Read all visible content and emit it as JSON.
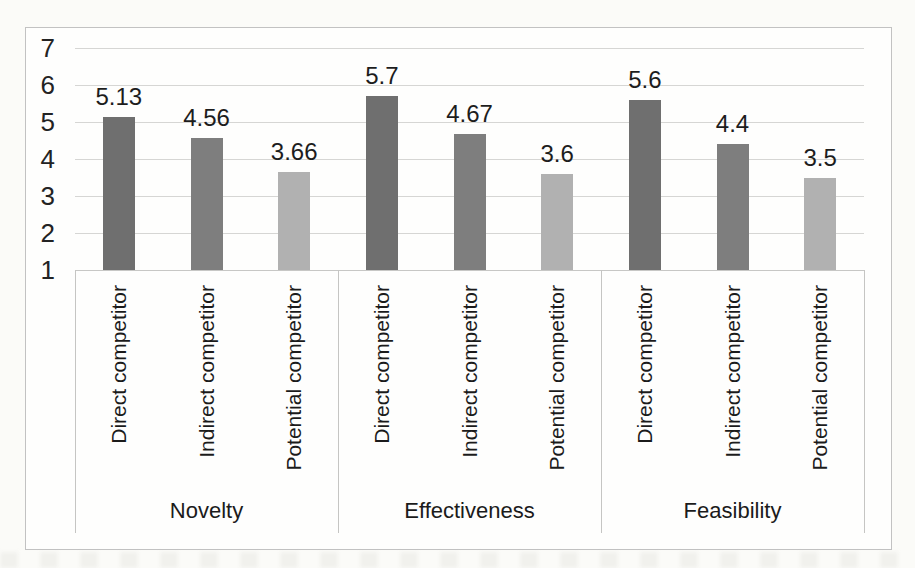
{
  "chart_data": {
    "type": "bar",
    "title": "",
    "y_axis": {
      "min": 1,
      "max": 7,
      "tick_labels": [
        "7",
        "6",
        "5",
        "4",
        "3",
        "2",
        "1"
      ],
      "gridlines": true
    },
    "categories_per_group": [
      "Direct competitor",
      "Indirect competitor",
      "Potential competitor"
    ],
    "groups": [
      {
        "label": "Novelty",
        "bars": [
          {
            "category": "Direct competitor",
            "value": 5.13,
            "value_label": "5.13"
          },
          {
            "category": "Indirect competitor",
            "value": 4.56,
            "value_label": "4.56"
          },
          {
            "category": "Potential competitor",
            "value": 3.66,
            "value_label": "3.66"
          }
        ]
      },
      {
        "label": "Effectiveness",
        "bars": [
          {
            "category": "Direct competitor",
            "value": 5.7,
            "value_label": "5.7"
          },
          {
            "category": "Indirect competitor",
            "value": 4.67,
            "value_label": "4.67"
          },
          {
            "category": "Potential competitor",
            "value": 3.6,
            "value_label": "3.6"
          }
        ]
      },
      {
        "label": "Feasibility",
        "bars": [
          {
            "category": "Direct competitor",
            "value": 5.6,
            "value_label": "5.6"
          },
          {
            "category": "Indirect competitor",
            "value": 4.4,
            "value_label": "4.4"
          },
          {
            "category": "Potential competitor",
            "value": 3.5,
            "value_label": "3.5"
          }
        ]
      }
    ],
    "series_colors": {
      "Direct competitor": "#6f6f6f",
      "Indirect competitor": "#7e7e7e",
      "Potential competitor": "#b1b1b1"
    },
    "legend": {
      "shown": false
    }
  }
}
